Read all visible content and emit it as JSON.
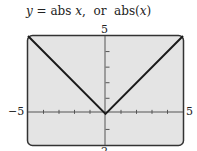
{
  "title": {
    "y_var": "y",
    "eq": " = abs ",
    "x_var": "x",
    "sep": ",  or  abs(",
    "x_var2": "x",
    "close": ")"
  },
  "chart_data": {
    "type": "line",
    "title": "y = abs x, or abs(x)",
    "xlabel": "",
    "ylabel": "",
    "xlim": [
      -5,
      5
    ],
    "ylim": [
      -2,
      5
    ],
    "x_ticks_step": 1,
    "y_ticks_step": 1,
    "grid": false,
    "series": [
      {
        "name": "abs(x)",
        "x": [
          -5,
          0,
          5
        ],
        "y": [
          5,
          0,
          5
        ]
      }
    ],
    "tick_labels": {
      "x_min": "−5",
      "x_max": "5",
      "y_max": "5",
      "y_min": "−2"
    }
  },
  "labels": {
    "x_min": "−5",
    "x_max": "5",
    "y_max": "5",
    "y_min": "2"
  },
  "colors": {
    "screen_bg": "#e4e4e4",
    "frame": "#333333",
    "line": "#1a1a1a"
  }
}
